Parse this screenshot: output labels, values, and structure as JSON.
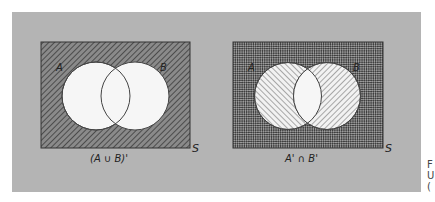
{
  "figure": {
    "background_color": "#b4b4b4",
    "panels": [
      {
        "id": "left",
        "caption": "(A ∪ B)'",
        "universe_label": "S",
        "set_labels": {
          "a": "A",
          "b": "B"
        },
        "shading": "Region outside both circles shaded with diagonal hatching; circles A and B unshaded (white)",
        "shaded_regions": [
          "outside A and B"
        ]
      },
      {
        "id": "right",
        "caption": "A' ∩ B'",
        "universe_label": "S",
        "set_labels": {
          "a": "A",
          "b": "B"
        },
        "shading": "A' hatched one direction, B' hatched other direction; overlap of A' and B' (outside both circles) cross-hatched; A ∩ B unshaded",
        "shaded_regions": [
          "outside A and B (cross-hatched)",
          "A only (hatched)",
          "B only (hatched)"
        ]
      }
    ],
    "side_text_fragments": [
      "F",
      "U",
      "("
    ]
  }
}
